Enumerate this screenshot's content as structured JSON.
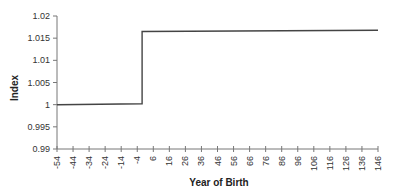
{
  "chart_data": {
    "type": "line",
    "title": "",
    "xlabel": "Year of Birth",
    "ylabel": "Index",
    "xlim": [
      -54,
      146
    ],
    "ylim": [
      0.99,
      1.02
    ],
    "grid": false,
    "legend": null,
    "x_ticks": [
      -54,
      -44,
      -34,
      -24,
      -14,
      -4,
      6,
      16,
      26,
      36,
      46,
      56,
      66,
      76,
      86,
      96,
      106,
      116,
      126,
      136,
      146
    ],
    "y_ticks": [
      0.99,
      0.995,
      1,
      1.005,
      1.01,
      1.015,
      1.02
    ],
    "y_tick_labels": [
      "0.99",
      "0.995",
      "1",
      "1.005",
      "1.01",
      "1.015",
      "1.02"
    ],
    "series": [
      {
        "name": "Index",
        "color": "#444444",
        "x": [
          -54,
          -1,
          -1,
          146
        ],
        "values": [
          1.0,
          1.0002,
          1.0165,
          1.0168
        ]
      }
    ],
    "annotations": [
      "Step increase at approximately year 0 (from ~1.000 to ~1.0165)"
    ]
  }
}
